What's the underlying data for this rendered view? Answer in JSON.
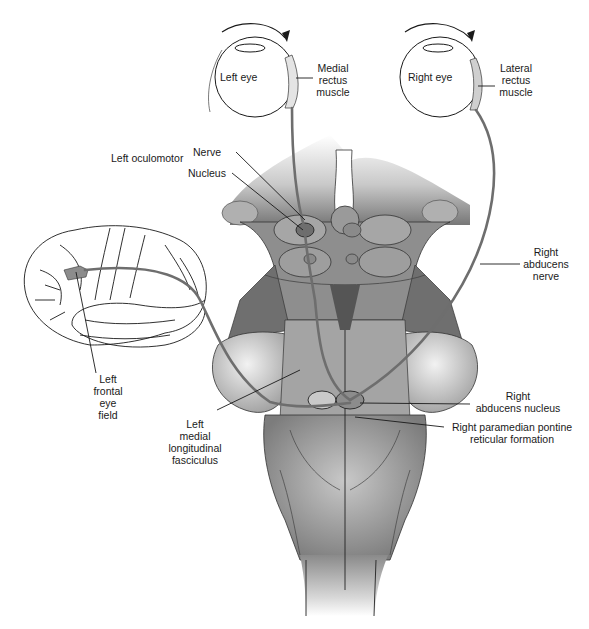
{
  "figure": {
    "colors": {
      "background": "#ffffff",
      "line": "#1a1a1a",
      "pathway": "#6e6e6e",
      "tissue_dark": "#7a7a7a",
      "tissue_mid": "#a8a8a8",
      "tissue_light": "#d9d9d9",
      "highlight": "#8c8c8c"
    }
  },
  "eyes": {
    "left": {
      "label": "Left eye",
      "rotation": "clockwise arrow (toward right)"
    },
    "right": {
      "label": "Right eye",
      "rotation": "clockwise arrow (toward right)"
    }
  },
  "labels": {
    "medial_rectus": [
      "Medial",
      "rectus",
      "muscle"
    ],
    "lateral_rectus": [
      "Lateral",
      "rectus",
      "muscle"
    ],
    "left_oculomotor": "Left oculomotor",
    "nerve": "Nerve",
    "nucleus": "Nucleus",
    "right_abducens_nerve": [
      "Right",
      "abducens",
      "nerve"
    ],
    "left_frontal_eye_field": [
      "Left",
      "frontal",
      "eye",
      "field"
    ],
    "left_mlf": [
      "Left",
      "medial",
      "longitudinal",
      "fasciculus"
    ],
    "right_abducens_nucleus": [
      "Right",
      "abducens nucleus"
    ],
    "right_pprf": [
      "Right paramedian pontine",
      "reticular formation"
    ]
  }
}
